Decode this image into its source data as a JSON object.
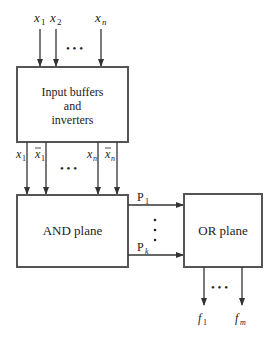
{
  "diagram": {
    "inputs": [
      {
        "label": "x",
        "sub": "1"
      },
      {
        "label": "x",
        "sub": "2"
      },
      {
        "label": "x",
        "sub": "n"
      }
    ],
    "input_ellipsis": "• • •",
    "buffer_box": {
      "line1": "Input buffers",
      "line2": "and",
      "line3": "inverters"
    },
    "literals": [
      {
        "label": "x",
        "sub": "1",
        "bar": false
      },
      {
        "label": "x",
        "sub": "1",
        "bar": true
      },
      {
        "label": "x",
        "sub": "n",
        "bar": false
      },
      {
        "label": "x",
        "sub": "n",
        "bar": true
      }
    ],
    "literal_ellipsis": "• • •",
    "and_box": {
      "label": "AND plane"
    },
    "products": [
      {
        "label": "P",
        "sub": "1"
      },
      {
        "label": "P",
        "sub": "k"
      }
    ],
    "or_box": {
      "label": "OR plane"
    },
    "outputs": [
      {
        "label": "f",
        "sub": "1"
      },
      {
        "label": "f",
        "sub": "m"
      }
    ],
    "output_ellipsis": "• • •"
  }
}
